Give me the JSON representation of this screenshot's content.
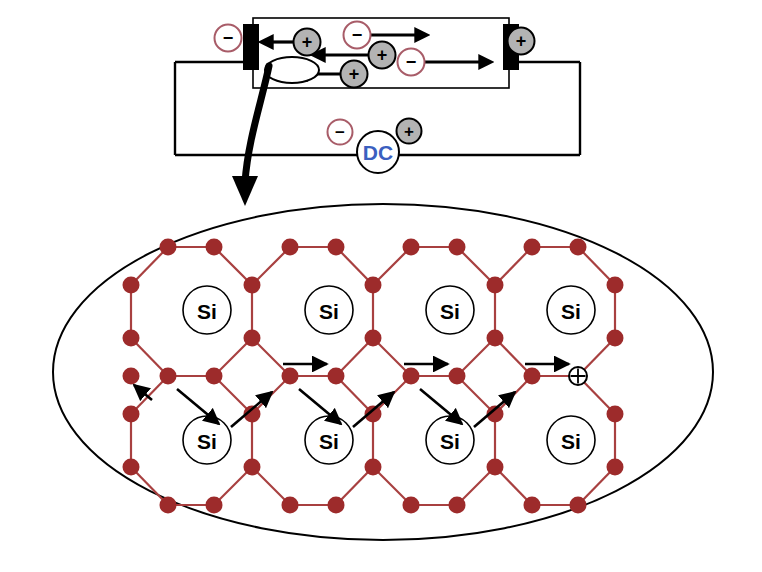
{
  "figure": {
    "colors": {
      "lattice_bond": "#a84040",
      "lattice_node": "#9d2b2b",
      "negative_outline": "#a85c68",
      "positive_fill": "#b3b3b3",
      "stroke_black": "#000000",
      "dc_label": "#3b5fc0",
      "background": "#ffffff"
    }
  },
  "circuit": {
    "name": "dc-biased-semiconductor-bar",
    "bar_label": "",
    "source": {
      "label": "DC",
      "negative_terminal": "−",
      "positive_terminal": "+"
    },
    "electrodes": {
      "left": {
        "polarity_label": "−",
        "name": "cathode"
      },
      "right": {
        "polarity_label": "+",
        "name": "anode"
      }
    },
    "carriers": [
      {
        "type": "hole",
        "label": "+",
        "direction": "left",
        "x": 307,
        "y": 42
      },
      {
        "type": "electron",
        "label": "−",
        "direction": "right",
        "x": 357,
        "y": 35
      },
      {
        "type": "hole",
        "label": "+",
        "direction": "left",
        "x": 382,
        "y": 55
      },
      {
        "type": "electron",
        "label": "−",
        "direction": "right",
        "x": 411,
        "y": 62
      },
      {
        "type": "hole",
        "label": "+",
        "direction": "left",
        "x": 354,
        "y": 74
      }
    ],
    "bar_hole_ellipse": {
      "name": "highlighted-hole",
      "label": ""
    }
  },
  "magnifier": {
    "name": "lattice-callout",
    "pointer_label": "",
    "atom_label": "Si",
    "atom_count": 8,
    "hole_marker": {
      "label": "⊕",
      "name": "hole-marker"
    },
    "hop_arrow_count": 10,
    "atoms": [
      {
        "row": "top",
        "col": 1,
        "label": "Si"
      },
      {
        "row": "top",
        "col": 2,
        "label": "Si"
      },
      {
        "row": "top",
        "col": 3,
        "label": "Si"
      },
      {
        "row": "top",
        "col": 4,
        "label": "Si"
      },
      {
        "row": "bottom",
        "col": 1,
        "label": "Si"
      },
      {
        "row": "bottom",
        "col": 2,
        "label": "Si"
      },
      {
        "row": "bottom",
        "col": 3,
        "label": "Si"
      },
      {
        "row": "bottom",
        "col": 4,
        "label": "Si"
      }
    ]
  }
}
